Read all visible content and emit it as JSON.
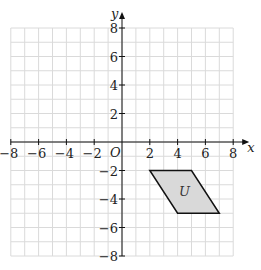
{
  "chart_data": {
    "type": "scatter",
    "title": "",
    "xlabel": "x",
    "ylabel": "y",
    "origin_label": "O",
    "xlim": [
      -8,
      8
    ],
    "ylim": [
      -8,
      8
    ],
    "grid": true,
    "x_ticks": [
      -8,
      -6,
      -4,
      -2,
      2,
      4,
      6,
      8
    ],
    "y_ticks": [
      8,
      6,
      4,
      2,
      -2,
      -4,
      -6,
      -8
    ],
    "x_tick_labels": [
      "−8",
      "−6",
      "−4",
      "−2",
      "2",
      "4",
      "6",
      "8"
    ],
    "y_tick_labels": [
      "8",
      "6",
      "4",
      "2",
      "−2",
      "−4",
      "−6",
      "−8"
    ],
    "shapes": [
      {
        "name": "U",
        "type": "parallelogram",
        "vertices": [
          [
            2,
            -2
          ],
          [
            5,
            -2
          ],
          [
            7,
            -5
          ],
          [
            4,
            -5
          ]
        ],
        "fill": "#d9d9d9",
        "stroke": "#111111"
      }
    ]
  },
  "colors": {
    "grid": "#dadada",
    "axis": "#111111"
  }
}
